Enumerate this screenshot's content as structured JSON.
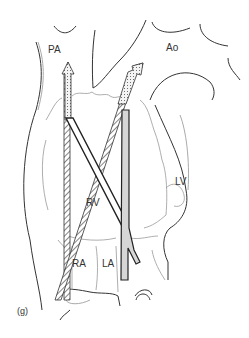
{
  "figure": {
    "panel_label": "(g)",
    "labels": {
      "pa": "PA",
      "ao": "Ao",
      "rv": "RV",
      "lv": "LV",
      "ra": "RA",
      "la": "LA"
    },
    "colors": {
      "outline": "#333333",
      "light_outline": "#999999",
      "arrow_fill_dotted": "#dddddd",
      "arrow_fill_gray": "#cccccc"
    }
  }
}
